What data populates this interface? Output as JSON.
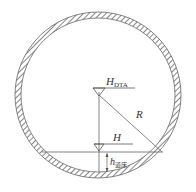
{
  "diagram": {
    "title": "",
    "labels": {
      "h_dta_main": "H",
      "h_dta_sub": "DTA",
      "radius": "R",
      "h_main": "H",
      "h_bed_main": "h",
      "h_bed_sub": "道床"
    },
    "colors": {
      "line": "#555555",
      "hatch": "#444444",
      "background": "#ffffff"
    }
  }
}
